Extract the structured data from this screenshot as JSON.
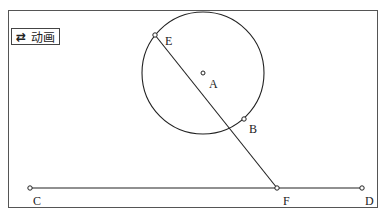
{
  "animation_button": {
    "icon": "⇄",
    "label": "动画"
  },
  "points": {
    "A": {
      "label": "A",
      "x": 203,
      "y": 73,
      "lx": 209,
      "ly": 88
    },
    "B": {
      "label": "B",
      "x": 244,
      "y": 119,
      "lx": 249,
      "ly": 133
    },
    "C": {
      "label": "C",
      "x": 30,
      "y": 188,
      "lx": 33,
      "ly": 205
    },
    "D": {
      "label": "D",
      "x": 362,
      "y": 188,
      "lx": 365,
      "ly": 205
    },
    "E": {
      "label": "E",
      "x": 155,
      "y": 35,
      "lx": 165,
      "ly": 45
    },
    "F": {
      "label": "F",
      "x": 277,
      "y": 188,
      "lx": 283,
      "ly": 205
    }
  },
  "circle": {
    "cx": 203,
    "cy": 73,
    "r": 61
  },
  "colors": {
    "stroke": "#222222",
    "frame": "#555555"
  }
}
